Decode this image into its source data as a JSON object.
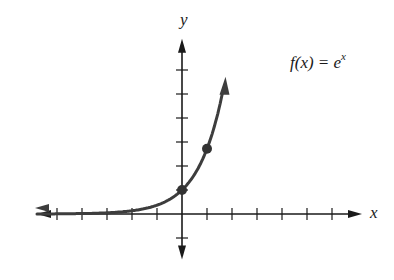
{
  "chart_data": {
    "type": "line",
    "xlabel": "x",
    "ylabel": "y",
    "function": "e^x",
    "xlim": [
      -5.8,
      7.2
    ],
    "ylim": [
      -1.9,
      7.3
    ],
    "x_ticks": [
      -5,
      -4,
      -3,
      -2,
      -1,
      1,
      2,
      3,
      4,
      5,
      6
    ],
    "y_ticks": [
      -1,
      1,
      2,
      3,
      4,
      5,
      6
    ],
    "tick_labels_shown": false,
    "grid": false,
    "legend": null,
    "series": [
      {
        "name": "f(x) = e^x",
        "x": [
          -5.8,
          -5,
          -4,
          -3,
          -2,
          -1,
          0,
          0.5,
          1,
          1.5,
          1.8,
          2.0
        ],
        "values": [
          0.003,
          0.007,
          0.018,
          0.05,
          0.135,
          0.368,
          1.0,
          1.649,
          2.718,
          4.482,
          6.05,
          7.39
        ],
        "color": "#3d3d3d"
      }
    ],
    "highlighted_points": [
      {
        "x": 0,
        "y": 1
      },
      {
        "x": 1,
        "y": 2.718
      }
    ],
    "annotations": [
      {
        "text": "f(x) = e^x",
        "position": "upper-right"
      }
    ]
  },
  "labels": {
    "x_axis": "x",
    "y_axis": "y",
    "formula_main": "f(x) = e",
    "formula_sup": "x"
  },
  "colors": {
    "axis": "#1a1a1a",
    "curve": "#3d3d3d",
    "point": "#333333"
  }
}
